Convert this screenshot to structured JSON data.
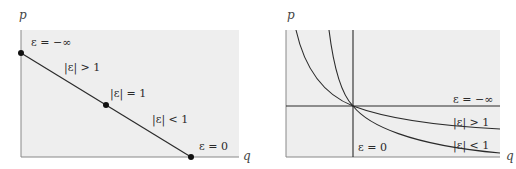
{
  "figure": {
    "colors": {
      "background": "#ffffff",
      "panel": "#eeeeee",
      "line": "#2b2b2b",
      "text": "#2a2a2a"
    }
  },
  "left_panel": {
    "y_axis_label": "p",
    "x_axis_label": "q",
    "curve": "linear demand",
    "points": [
      {
        "label": "ε = −∞",
        "position": "y-intercept"
      },
      {
        "label": "|ε| = 1",
        "position": "midpoint"
      },
      {
        "label": "ε = 0",
        "position": "x-intercept"
      }
    ],
    "region_labels": [
      "|ε| > 1",
      "|ε| < 1"
    ]
  },
  "right_panel": {
    "y_axis_label": "p",
    "x_axis_label": "q",
    "curves": [
      {
        "label": "ε = −∞",
        "shape": "horizontal line"
      },
      {
        "label": "|ε| > 1",
        "shape": "flatter hyperbola"
      },
      {
        "label": "|ε| < 1",
        "shape": "steeper hyperbola"
      },
      {
        "label": "ε = 0",
        "shape": "vertical line"
      }
    ]
  }
}
